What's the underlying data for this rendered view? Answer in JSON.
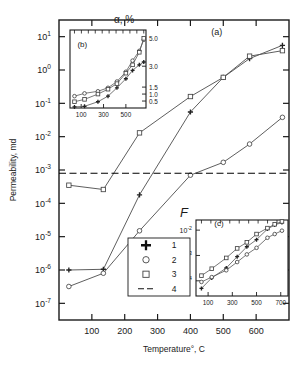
{
  "figure": {
    "panel_a_label": "(a)",
    "panel_b_label": "(b)",
    "panel_c_label": "(c)"
  },
  "main": {
    "ylabel": "Permeability, md",
    "xlabel": "Temperature°, C",
    "y_ticks": [
      "10¹",
      "10⁰",
      "10⁻¹",
      "10⁻²",
      "10⁻³",
      "10⁻⁴",
      "10⁻⁵",
      "10⁻⁶",
      "10⁻⁷"
    ],
    "x_ticks": [
      "100",
      "200",
      "300",
      "400",
      "500",
      "600"
    ]
  },
  "inset_b": {
    "title": "α, %",
    "y_ticks": [
      "5.0",
      "3.0",
      "1.5",
      "1.0",
      "0.5"
    ],
    "x_ticks": [
      "100",
      "300",
      "500"
    ]
  },
  "inset_c": {
    "title": "F",
    "y_ticks": [
      "10⁻²",
      "10⁻³",
      "10⁻⁴"
    ],
    "x_ticks": [
      "100",
      "300",
      "500",
      "700"
    ]
  },
  "legend": {
    "items": [
      {
        "label": "1",
        "marker": "plus-marker"
      },
      {
        "label": "2",
        "marker": "circle-marker"
      },
      {
        "label": "3",
        "marker": "square-marker"
      },
      {
        "label": "4",
        "marker": "dashed-line-marker"
      }
    ]
  },
  "colors": {
    "axis": "#1a1a1a",
    "curve": "#555555",
    "marker_edge": "#444444",
    "threshold": "#000000",
    "background": "#ffffff"
  },
  "chart_data": [
    {
      "type": "line",
      "name": "panel-a",
      "title": "(a)",
      "xlabel": "Temperature°, C",
      "ylabel": "Permeability, md",
      "xlim": [
        0,
        700
      ],
      "ylim_log10": [
        -7.5,
        1.5
      ],
      "yscale": "log",
      "grid": false,
      "legend_position": "inside-bottom-center",
      "xticks": [
        100,
        200,
        300,
        400,
        500,
        600
      ],
      "yticks_log10": [
        1,
        0,
        -1,
        -2,
        -3,
        -4,
        -5,
        -6,
        -7
      ],
      "annotations": [
        {
          "text": "(a)",
          "x": 480,
          "y_log10": 1.05
        }
      ],
      "series": [
        {
          "name": "1",
          "marker": "plus",
          "x": [
            30,
            135,
            245,
            400,
            500,
            580,
            680
          ],
          "y": [
            1e-06,
            1.05e-06,
            0.00018,
            0.055,
            0.6,
            2.2,
            5.5
          ]
        },
        {
          "name": "2",
          "marker": "circle",
          "x": [
            30,
            135,
            245,
            400,
            500,
            580,
            680
          ],
          "y": [
            3.2e-07,
            8e-07,
            1.5e-05,
            0.0007,
            0.0017,
            0.006,
            0.038
          ]
        },
        {
          "name": "3",
          "marker": "square",
          "x": [
            30,
            135,
            245,
            400,
            500,
            580,
            680
          ],
          "y": [
            0.00035,
            0.00026,
            0.013,
            0.16,
            0.6,
            2.6,
            3.8
          ]
        },
        {
          "name": "4",
          "marker": "dashed-line",
          "type": "horizontal-threshold",
          "y": 0.0008
        }
      ]
    },
    {
      "type": "line",
      "name": "panel-b",
      "title": "α, %",
      "xlabel": "",
      "ylabel": "α, %",
      "xlim": [
        0,
        680
      ],
      "ylim": [
        0,
        5.6
      ],
      "yscale": "linear",
      "grid": false,
      "xticks": [
        100,
        300,
        500
      ],
      "yticks": [
        0.5,
        1.0,
        1.5,
        3.0,
        5.0
      ],
      "annotations": [
        {
          "text": "(b)",
          "x": 110,
          "y": 4.4
        }
      ],
      "series": [
        {
          "name": "1",
          "marker": "plus",
          "x": [
            40,
            130,
            250,
            340,
            420,
            500,
            560,
            620,
            660
          ],
          "y": [
            0.08,
            0.12,
            0.45,
            0.85,
            1.45,
            2.1,
            2.7,
            3.1,
            3.3
          ]
        },
        {
          "name": "2",
          "marker": "circle",
          "x": [
            40,
            130,
            250,
            340,
            420,
            500,
            560,
            620,
            660
          ],
          "y": [
            0.85,
            1.05,
            1.2,
            1.45,
            1.9,
            2.6,
            3.4,
            4.1,
            4.9
          ]
        },
        {
          "name": "3",
          "marker": "square",
          "x": [
            40,
            130,
            250,
            340,
            420,
            500,
            560,
            620,
            660
          ],
          "y": [
            0.45,
            0.62,
            1.0,
            1.35,
            1.75,
            2.5,
            3.1,
            4.0,
            5.0
          ]
        }
      ]
    },
    {
      "type": "line",
      "name": "panel-c",
      "title": "F",
      "xlabel": "",
      "ylabel": "F",
      "xlim": [
        0,
        760
      ],
      "ylim_log10": [
        -4.6,
        -1.6
      ],
      "yscale": "log",
      "grid": false,
      "xticks": [
        100,
        300,
        500,
        700
      ],
      "yticks_log10": [
        -2,
        -3,
        -4
      ],
      "annotations": [
        {
          "text": "(c)",
          "x": 190,
          "y_log10": -1.85
        }
      ],
      "series": [
        {
          "name": "1",
          "marker": "plus",
          "x": [
            45,
            130,
            250,
            340,
            420,
            500,
            590,
            650,
            710
          ],
          "y": [
            5e-05,
            0.00013,
            0.00032,
            0.0009,
            0.0022,
            0.0042,
            0.011,
            0.016,
            0.02
          ]
        },
        {
          "name": "2",
          "marker": "circle",
          "x": [
            45,
            130,
            250,
            340,
            420,
            500,
            590,
            650,
            710
          ],
          "y": [
            9e-05,
            0.00014,
            0.00026,
            0.00055,
            0.0011,
            0.002,
            0.005,
            0.007,
            0.0095
          ]
        },
        {
          "name": "3",
          "marker": "square",
          "x": [
            45,
            130,
            250,
            340,
            420,
            500,
            590,
            650,
            710
          ],
          "y": [
            0.00016,
            0.0003,
            0.0008,
            0.0019,
            0.0033,
            0.007,
            0.012,
            0.017,
            0.022
          ]
        }
      ]
    }
  ]
}
